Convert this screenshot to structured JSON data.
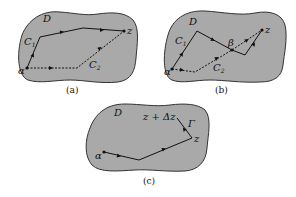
{
  "panels": [
    {
      "id": "a",
      "caption": "(a)",
      "region_label": "D",
      "start_label": "α",
      "end_label": "z",
      "curve1_label": "C",
      "curve1_sub": "1",
      "curve2_label": "C",
      "curve2_sub": "2"
    },
    {
      "id": "b",
      "caption": "(b)",
      "region_label": "D",
      "start_label": "α",
      "end_label": "z",
      "intersection_label": "β",
      "curve1_label": "C",
      "curve1_sub": "1",
      "curve2_label": "C",
      "curve2_sub": "2"
    },
    {
      "id": "c",
      "caption": "(c)",
      "region_label": "D",
      "start_label": "α",
      "end_label": "z",
      "increment_label": "z + Δz",
      "segment_label": "Γ"
    }
  ],
  "colors": {
    "region_fill": "#a9a9a9",
    "region_stroke": "#333333",
    "path": "#111111",
    "background": "#ffffff"
  }
}
